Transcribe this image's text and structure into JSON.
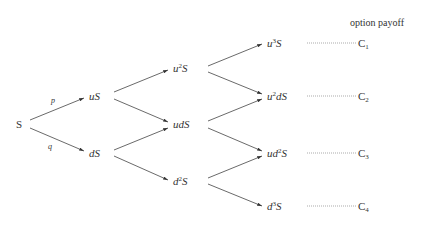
{
  "header": {
    "title": "option payoff"
  },
  "nodes": {
    "S": "S",
    "uS": "uS",
    "dS": "dS",
    "u2S_base": "u",
    "u2S_exp": "2",
    "u2S_tail": "S",
    "udS": "udS",
    "d2S_base": "d",
    "d2S_exp": "2",
    "d2S_tail": "S",
    "u3S_base": "u",
    "u3S_exp": "3",
    "u3S_tail": "S",
    "u2dS_base": "u",
    "u2dS_exp": "2",
    "u2dS_tail": "dS",
    "ud2S_base": "ud",
    "ud2S_exp": "2",
    "ud2S_tail": "S",
    "d3S_base": "d",
    "d3S_exp": "3",
    "d3S_tail": "S"
  },
  "branch_labels": {
    "up": "p",
    "down": "q"
  },
  "payoffs": [
    {
      "base": "C",
      "sub": "1"
    },
    {
      "base": "C",
      "sub": "2"
    },
    {
      "base": "C",
      "sub": "3"
    },
    {
      "base": "C",
      "sub": "4"
    }
  ]
}
